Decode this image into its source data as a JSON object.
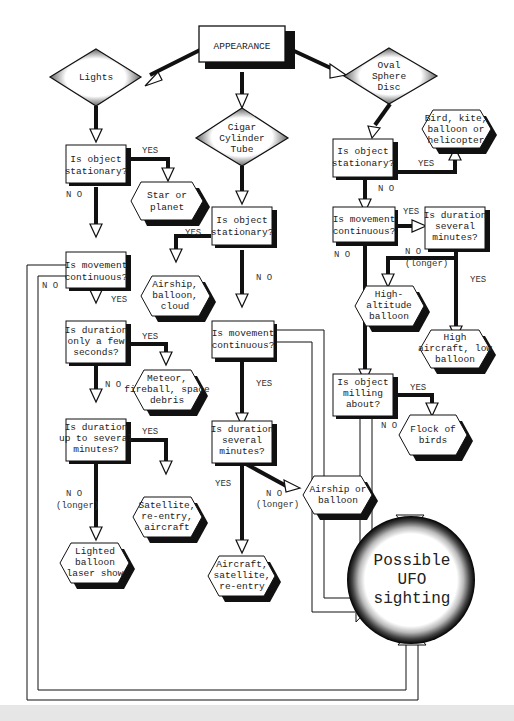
{
  "title": "APPEARANCE",
  "categories": {
    "lights": "Lights",
    "cigar": [
      "Cigar",
      "Cylinder",
      "Tube"
    ],
    "oval": [
      "Oval",
      "Sphere",
      "Disc"
    ]
  },
  "questions": {
    "lights_stationary": [
      "Is object",
      "stationary?"
    ],
    "lights_continuous": [
      "Is movement",
      "continuous?"
    ],
    "lights_few_seconds": [
      "Is duration",
      "only a few",
      "seconds?"
    ],
    "lights_several_minutes": [
      "Is duration",
      "up to several",
      "minutes?"
    ],
    "cigar_stationary": [
      "Is object",
      "stationary?"
    ],
    "cigar_continuous": [
      "Is movement",
      "continuous?"
    ],
    "cigar_several_minutes": [
      "Is duration",
      "several",
      "minutes?"
    ],
    "oval_stationary": [
      "Is object",
      "stationary?"
    ],
    "oval_continuous": [
      "Is movement",
      "continuous?"
    ],
    "oval_several_minutes": [
      "Is duration",
      "several",
      "minutes?"
    ],
    "oval_milling": [
      "Is object",
      "milling",
      "about?"
    ]
  },
  "outcomes": {
    "star_planet": [
      "Star or",
      "planet"
    ],
    "meteor": [
      "Meteor,",
      "fireball, space",
      "debris"
    ],
    "satellite": [
      "Satellite,",
      "re-entry,",
      "aircraft"
    ],
    "lighted_balloon": [
      "Lighted",
      "balloon",
      "laser show"
    ],
    "airship_cloud": [
      "Airship,",
      "balloon,",
      "cloud"
    ],
    "aircraft_sat": [
      "Aircraft,",
      "satellite,",
      "re-entry"
    ],
    "airship_balloon": [
      "Airship or",
      "balloon"
    ],
    "bird_kite": [
      "Bird, kite,",
      "balloon or",
      "helicopter"
    ],
    "high_alt": [
      "High-",
      "altitude",
      "balloon"
    ],
    "high_aircraft": [
      "High",
      "aircraft, low",
      "balloon"
    ],
    "flock": [
      "Flock of",
      "birds"
    ],
    "ufo": [
      "Possible",
      "UFO",
      "sighting"
    ]
  },
  "labels": {
    "yes": "YES",
    "no": "N O",
    "longer": "(longer)"
  },
  "colors": {
    "ink": "#111111",
    "shadow": "#1a1a1a",
    "paper": "#ffffff"
  }
}
